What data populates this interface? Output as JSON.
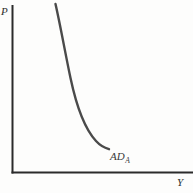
{
  "figure": {
    "type": "economics-diagram",
    "title_visible": false,
    "background_color": "#fdfdfc",
    "axes": {
      "vertical": {
        "label": "P",
        "name": "price-level-axis",
        "color": "#2b2b2b",
        "x": 12.5,
        "y_top": 5,
        "y_bottom": 173,
        "width": 2
      },
      "horizontal": {
        "label": "Y",
        "name": "output-axis",
        "color": "#2b2b2b",
        "y": 172.5,
        "x_left": 12,
        "x_right": 193,
        "width": 2
      }
    },
    "curves": [
      {
        "id": "AD_A",
        "label_main": "AD",
        "label_sub": "A",
        "description": "downward-sloping aggregate demand curve",
        "color": "#4a4a4a",
        "stroke_width": 2.4,
        "path": "M 55.5,4 C 60.5,26 65,52 70.5,78 C 76,104 84,128 96,141 C 101,146.5 105,148 109,149.2",
        "start_point": [
          55.5,
          4
        ],
        "end_point": [
          109,
          149
        ]
      }
    ]
  },
  "chart_data": {
    "type": "line",
    "title": "",
    "xlabel": "Y",
    "ylabel": "P",
    "grid": false,
    "legend": "none",
    "annotations": [
      "AD_A"
    ],
    "series": [
      {
        "name": "AD_A",
        "x": [
          55.5,
          62,
          70.5,
          79,
          88,
          96,
          103,
          109
        ],
        "y": [
          4,
          30,
          78,
          106,
          128,
          141,
          146,
          149
        ]
      }
    ]
  }
}
